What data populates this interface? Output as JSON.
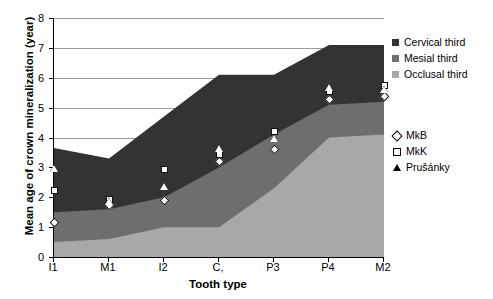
{
  "chart_data": {
    "type": "area",
    "title": "",
    "xlabel": "Tooth type",
    "ylabel": "Mean age of crown mineralization (year)",
    "categories": [
      "I1",
      "M1",
      "I2",
      "C,",
      "P3",
      "P4",
      "M2"
    ],
    "ylim": [
      0,
      8
    ],
    "yticks": [
      "0",
      "1",
      "2",
      "3",
      "4",
      "5",
      "6",
      "7",
      "8"
    ],
    "grid": true,
    "stacked": true,
    "legend_position": "right",
    "series": [
      {
        "name": "Occlusal third",
        "color": "#a8a8a8",
        "cumulative": [
          0.5,
          0.6,
          1.0,
          1.0,
          2.3,
          4.0,
          4.1
        ],
        "values": [
          0.5,
          0.6,
          1.0,
          1.0,
          2.3,
          4.0,
          4.1
        ]
      },
      {
        "name": "Mesial third",
        "color": "#6e6e6e",
        "cumulative": [
          1.5,
          1.6,
          2.0,
          3.0,
          4.1,
          5.1,
          5.2
        ],
        "values": [
          1.0,
          1.0,
          1.0,
          2.0,
          1.8,
          1.1,
          1.1
        ]
      },
      {
        "name": "Cervical third",
        "color": "#333333",
        "cumulative": [
          3.65,
          3.3,
          4.7,
          6.1,
          6.1,
          7.1,
          7.1
        ],
        "values": [
          2.15,
          1.7,
          2.7,
          3.1,
          2.0,
          2.0,
          1.9
        ]
      }
    ],
    "point_series": [
      {
        "name": "MkB",
        "marker": "diamond",
        "values": [
          1.15,
          1.75,
          1.9,
          3.2,
          3.6,
          5.3,
          5.4
        ]
      },
      {
        "name": "MkK",
        "marker": "square",
        "values": [
          2.25,
          1.95,
          2.95,
          3.45,
          4.2,
          5.55,
          5.75
        ]
      },
      {
        "name": "Prušánky",
        "marker": "triangle",
        "values": [
          2.95,
          1.85,
          2.35,
          3.6,
          3.95,
          5.65,
          5.6
        ]
      }
    ]
  },
  "legend_bands": {
    "items": [
      {
        "label": "Cervical third",
        "color": "#333333"
      },
      {
        "label": "Mesial third",
        "color": "#6e6e6e"
      },
      {
        "label": "Occlusal third",
        "color": "#a8a8a8"
      }
    ]
  },
  "legend_sites": {
    "items": [
      {
        "label": "MkB",
        "marker": "diamond"
      },
      {
        "label": "MkK",
        "marker": "square"
      },
      {
        "label": "Prušánky",
        "marker": "triangle"
      }
    ]
  }
}
